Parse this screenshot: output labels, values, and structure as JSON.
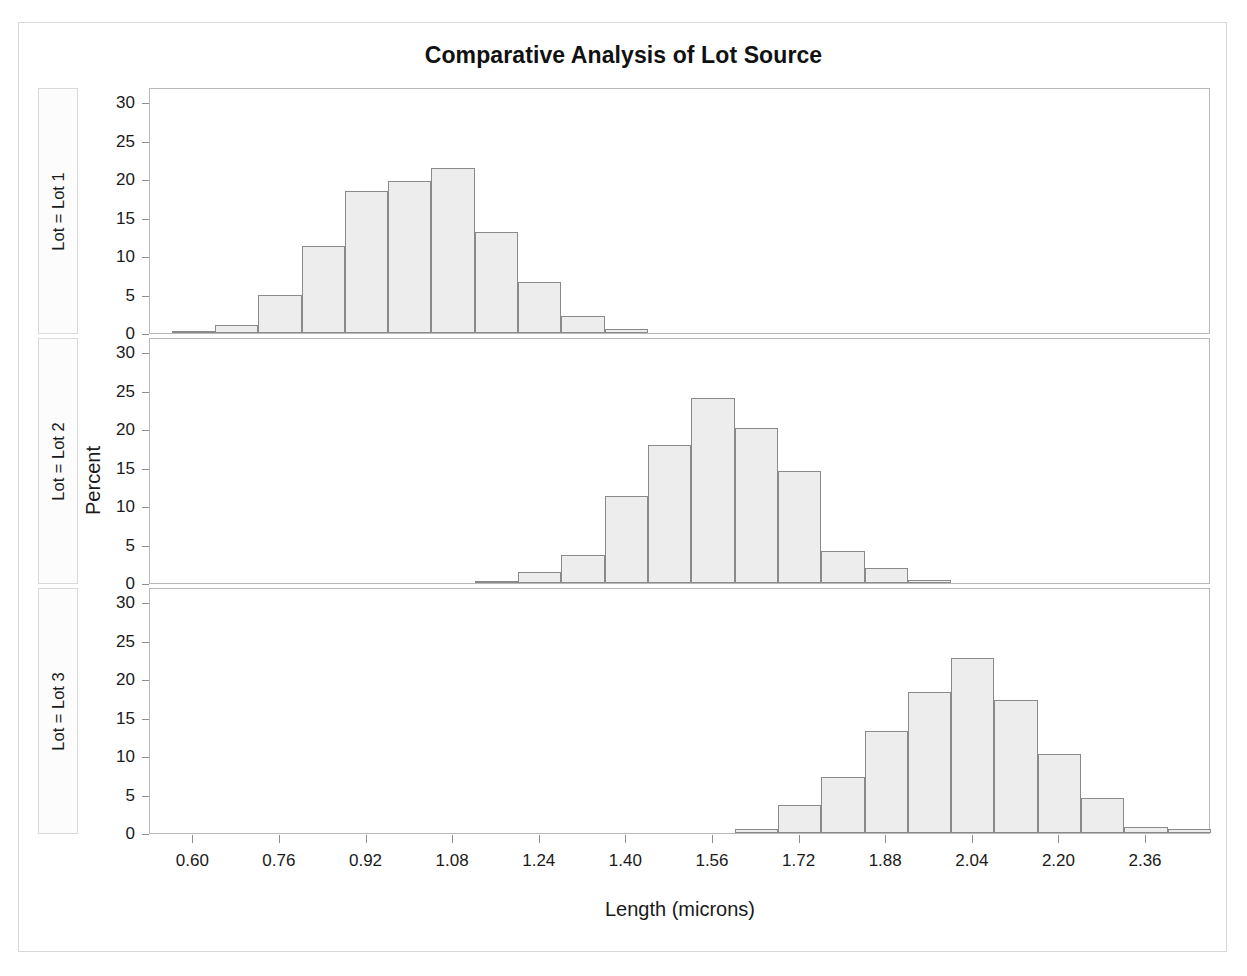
{
  "figure": {
    "title": "Comparative Analysis of Lot Source",
    "width": 1247,
    "height": 976,
    "background": "#ffffff",
    "frame_color": "#d8d8d8"
  },
  "axes": {
    "x_title": "Length (microns)",
    "y_title": "Percent",
    "x_tick_labels": [
      "0.60",
      "0.76",
      "0.92",
      "1.08",
      "1.24",
      "1.40",
      "1.56",
      "1.72",
      "1.88",
      "2.04",
      "2.20",
      "2.36"
    ],
    "x_tick_values": [
      0.6,
      0.76,
      0.92,
      1.08,
      1.24,
      1.4,
      1.56,
      1.72,
      1.88,
      2.04,
      2.2,
      2.36
    ],
    "y_tick_labels": [
      "0",
      "5",
      "10",
      "15",
      "20",
      "25",
      "30"
    ],
    "y_tick_values": [
      0,
      5,
      10,
      15,
      20,
      25,
      30
    ]
  },
  "panels": [
    {
      "label": "Lot = Lot 1"
    },
    {
      "label": "Lot = Lot 2"
    },
    {
      "label": "Lot = Lot 3"
    }
  ],
  "style": {
    "bar_fill": "#ededed",
    "bar_border": "#8a8a8a",
    "panel_border": "#b9b9b9",
    "label_box_border": "#d9d9d9",
    "label_box_fill": "#fcfcfc",
    "tick_color": "#8e8e8e",
    "text_color": "#1a1a1a"
  },
  "chart_data": {
    "type": "bar",
    "subtype": "histogram-panel-grid",
    "title": "Comparative Analysis of Lot Source",
    "xlabel": "Length (microns)",
    "ylabel": "Percent",
    "xlim": [
      0.52,
      2.48
    ],
    "ylim": [
      0,
      32
    ],
    "bin_width": 0.08,
    "grid": false,
    "legend_position": "none",
    "panel_variable": "Lot",
    "panels": [
      {
        "name": "Lot = Lot 1",
        "panel_value": "Lot 1",
        "bin_centers": [
          0.6,
          0.68,
          0.76,
          0.84,
          0.92,
          1.0,
          1.08,
          1.16,
          1.24,
          1.32,
          1.4
        ],
        "values": [
          0.3,
          1.1,
          5.0,
          11.3,
          18.5,
          19.8,
          21.5,
          13.2,
          6.7,
          2.2,
          0.5
        ]
      },
      {
        "name": "Lot = Lot 2",
        "panel_value": "Lot 2",
        "bin_centers": [
          1.16,
          1.24,
          1.32,
          1.4,
          1.48,
          1.56,
          1.64,
          1.72,
          1.8,
          1.88,
          1.96
        ],
        "values": [
          0.2,
          1.4,
          3.7,
          11.3,
          17.9,
          24.1,
          20.2,
          14.6,
          4.2,
          1.9,
          0.4
        ]
      },
      {
        "name": "Lot = Lot 3",
        "panel_value": "Lot 3",
        "bin_centers": [
          1.64,
          1.72,
          1.8,
          1.88,
          1.96,
          2.04,
          2.12,
          2.2,
          2.28,
          2.36,
          2.44
        ],
        "values": [
          0.5,
          3.7,
          7.3,
          13.3,
          18.3,
          22.8,
          17.3,
          10.3,
          4.6,
          0.8,
          0.5
        ]
      }
    ]
  }
}
